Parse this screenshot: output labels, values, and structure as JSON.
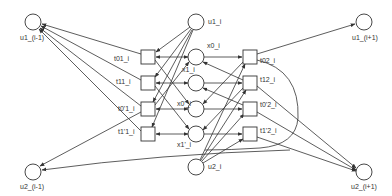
{
  "diagram": {
    "type": "petri-net",
    "colors": {
      "stroke": "#333333",
      "fill": "#ffffff",
      "text": "#333333"
    },
    "places": [
      {
        "id": "u1_im1",
        "label": "u1_(i-1)",
        "x": 33,
        "y": 22
      },
      {
        "id": "u2_im1",
        "label": "u2_(i-1)",
        "x": 33,
        "y": 172
      },
      {
        "id": "u1_i",
        "label": "u1_i",
        "x": 196,
        "y": 22
      },
      {
        "id": "x0_i",
        "label": "x0_i",
        "x": 196,
        "y": 57
      },
      {
        "id": "x1_i",
        "label": "x1_i",
        "x": 196,
        "y": 83
      },
      {
        "id": "x0p_i",
        "label": "x0'_i",
        "x": 196,
        "y": 109
      },
      {
        "id": "x1p_i",
        "label": "x1'_i",
        "x": 196,
        "y": 134
      },
      {
        "id": "u2_i",
        "label": "u2_i",
        "x": 196,
        "y": 167
      },
      {
        "id": "u1_ip1",
        "label": "u1_(i+1)",
        "x": 364,
        "y": 22
      },
      {
        "id": "u2_ip1",
        "label": "u2_(i+1)",
        "x": 364,
        "y": 172
      }
    ],
    "transitions": [
      {
        "id": "t01_i",
        "label": "t01_i",
        "x": 148,
        "y": 57
      },
      {
        "id": "t11_i",
        "label": "t11_i",
        "x": 148,
        "y": 83
      },
      {
        "id": "t0p1_i",
        "label": "t0'1_i",
        "x": 148,
        "y": 109
      },
      {
        "id": "t1p1_i",
        "label": "t1'1_i",
        "x": 148,
        "y": 134
      },
      {
        "id": "t02_i",
        "label": "t02_i",
        "x": 250,
        "y": 57
      },
      {
        "id": "t12_i",
        "label": "t12_i",
        "x": 250,
        "y": 83
      },
      {
        "id": "t0p2_i",
        "label": "t0'2_i",
        "x": 250,
        "y": 109
      },
      {
        "id": "t1p2_i",
        "label": "t1'2_i",
        "x": 250,
        "y": 134
      }
    ]
  }
}
